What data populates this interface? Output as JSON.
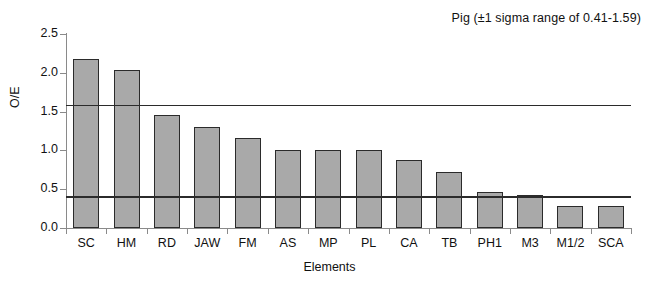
{
  "chart_data": {
    "type": "bar",
    "title": "Pig (±1 sigma range of 0.41-1.59)",
    "xlabel": "Elements",
    "ylabel": "O/E",
    "categories": [
      "SC",
      "HM",
      "RD",
      "JAW",
      "FM",
      "AS",
      "MP",
      "PL",
      "CA",
      "TB",
      "PH1",
      "M3",
      "M1/2",
      "SCA"
    ],
    "values": [
      2.18,
      2.04,
      1.45,
      1.3,
      1.16,
      1.01,
      1.01,
      1.01,
      0.87,
      0.72,
      0.47,
      0.43,
      0.28,
      0.28
    ],
    "ylim": [
      0.0,
      2.5
    ],
    "ytick_labels": [
      "0.0",
      "0.5",
      "1.0",
      "1.5",
      "2.0",
      "2.5"
    ],
    "ytick_values": [
      0.0,
      0.5,
      1.0,
      1.5,
      2.0,
      2.5
    ],
    "grid": false,
    "legend": "none",
    "reference_lines": [
      {
        "name": "upper-sigma-line",
        "value": 1.59
      },
      {
        "name": "lower-sigma-line",
        "value": 0.41
      }
    ],
    "bar_fill_color": "#a9a9a9",
    "bar_edge_color": "#2b2b2b",
    "axis_color": "#8a8a8a",
    "background_color": "#ffffff"
  }
}
